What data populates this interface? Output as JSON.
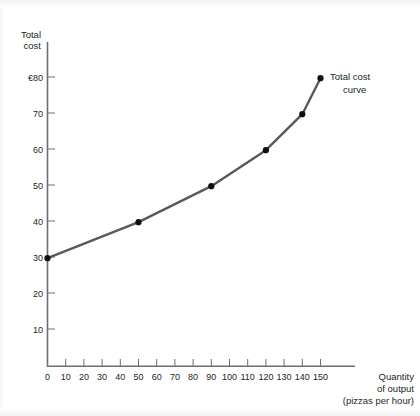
{
  "chart_data": {
    "type": "line",
    "title": "",
    "subtitle": "",
    "ylabel_line1": "Total",
    "ylabel_line2": "cost",
    "xlabel_line1": "Quantity",
    "xlabel_line2": "of output",
    "xlabel_line3": "(pizzas per hour)",
    "currency_symbol": "€",
    "x": [
      0,
      50,
      90,
      120,
      140,
      150
    ],
    "y": [
      30,
      40,
      50,
      60,
      70,
      80
    ],
    "points": [
      {
        "x": 0,
        "y": 30
      },
      {
        "x": 50,
        "y": 40
      },
      {
        "x": 90,
        "y": 50
      },
      {
        "x": 120,
        "y": 60
      },
      {
        "x": 140,
        "y": 70
      },
      {
        "x": 150,
        "y": 80
      }
    ],
    "series": [
      {
        "name": "Total cost curve",
        "values": [
          30,
          40,
          50,
          60,
          70,
          80
        ],
        "color": "#58595b"
      }
    ],
    "annotations": [
      {
        "name": "curve-label",
        "line1": "Total cost",
        "line2": "curve",
        "target_x": 150,
        "target_y": 80
      }
    ],
    "xlim": [
      0,
      158
    ],
    "ylim": [
      0,
      86
    ],
    "grid": false,
    "legend_position": "none",
    "xticks": [
      0,
      10,
      20,
      30,
      40,
      50,
      60,
      70,
      80,
      90,
      100,
      110,
      120,
      130,
      140,
      150
    ],
    "xtick_labels": [
      "0",
      "10",
      "20",
      "30",
      "40",
      "50",
      "60",
      "70",
      "80",
      "90",
      "100",
      "110",
      "120",
      "130",
      "140",
      "150"
    ],
    "yticks": [
      10,
      20,
      30,
      40,
      50,
      60,
      70,
      80
    ],
    "ytick_labels": [
      "10",
      "20",
      "30",
      "40",
      "50",
      "60",
      "70",
      "€80"
    ],
    "colors": {
      "curve": "#58595b",
      "axis": "#6d6e71",
      "point": "#0f0f0f",
      "text": "#231f20",
      "background": "#ffffff"
    }
  }
}
